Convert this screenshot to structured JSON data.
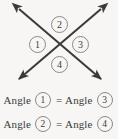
{
  "figure": {
    "type": "geometry-diagram",
    "background_color": "#f7f6f4",
    "diagram": {
      "description": "Two intersecting double-headed arrows forming an X with four labeled angle regions",
      "line_color": "#3c3a39",
      "line_width": 2,
      "intersection": {
        "x": 60,
        "y": 44
      },
      "lines": [
        {
          "name": "line-nw-se",
          "x1": 19,
          "y1": 9,
          "x2": 101,
          "y2": 79,
          "double_headed": true
        },
        {
          "name": "line-ne-sw",
          "x1": 101,
          "y1": 9,
          "x2": 19,
          "y2": 79,
          "double_headed": true
        }
      ],
      "angle_labels": [
        {
          "id": "1",
          "label": "1",
          "position": "left"
        },
        {
          "id": "2",
          "label": "2",
          "position": "top"
        },
        {
          "id": "3",
          "label": "3",
          "position": "right"
        },
        {
          "id": "4",
          "label": "4",
          "position": "bottom"
        }
      ],
      "badge_border_color": "#8c8a88"
    },
    "equations": [
      {
        "id": "equation-1",
        "left_word": "Angle",
        "left_number": "1",
        "operator": "=",
        "right_word": "Angle",
        "right_number": "3"
      },
      {
        "id": "equation-2",
        "left_word": "Angle",
        "left_number": "2",
        "operator": "=",
        "right_word": "Angle",
        "right_number": "4"
      }
    ]
  }
}
